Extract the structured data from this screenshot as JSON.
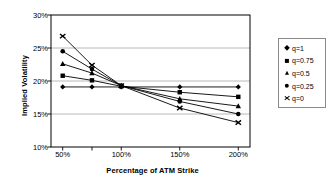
{
  "chart_data": {
    "type": "line",
    "title": "",
    "xlabel": "Percentage of ATM Strike",
    "ylabel": "Implied Volatility",
    "x": [
      50,
      75,
      100,
      150,
      200
    ],
    "xtick_labels": [
      "50%",
      "75%",
      "100%",
      "150%",
      "200%"
    ],
    "xtick_labels_shown": [
      "50%",
      "100%",
      "150%",
      "200%"
    ],
    "ytick_labels": [
      "10%",
      "15%",
      "20%",
      "25%",
      "30%"
    ],
    "ylim": [
      10,
      30
    ],
    "xlim": [
      40,
      210
    ],
    "grid": "horizontal",
    "legend_position": "right",
    "series": [
      {
        "name": "q=1",
        "marker": "diamond",
        "values": [
          19.1,
          19.1,
          19.1,
          19.1,
          19.1
        ]
      },
      {
        "name": "q=0.75",
        "marker": "square",
        "values": [
          20.8,
          20.1,
          19.2,
          18.3,
          17.6
        ]
      },
      {
        "name": "q=0.5",
        "marker": "triangle",
        "values": [
          22.6,
          21.2,
          19.3,
          17.3,
          16.2
        ]
      },
      {
        "name": "q=0.25",
        "marker": "circle",
        "values": [
          24.5,
          21.8,
          19.3,
          16.9,
          15.0
        ]
      },
      {
        "name": "q=0",
        "marker": "x",
        "values": [
          26.8,
          22.4,
          19.3,
          15.9,
          13.7
        ]
      }
    ]
  },
  "colors": {
    "line": "#000000",
    "axis": "#000000",
    "grid": "#a6a6a6",
    "legend_border": "#8a8a8a",
    "background": "#ffffff"
  }
}
